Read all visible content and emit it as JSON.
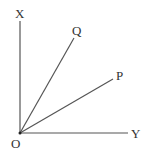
{
  "diagram": {
    "type": "angle-rays",
    "points": {
      "origin": {
        "label": "O",
        "x": 20,
        "y": 133
      },
      "X": {
        "label": "X",
        "x": 20,
        "y": 21
      },
      "Y": {
        "label": "Y",
        "x": 128,
        "y": 133
      },
      "Q": {
        "label": "Q",
        "x": 74,
        "y": 38
      },
      "P": {
        "label": "P",
        "x": 113,
        "y": 79
      }
    },
    "rays": [
      {
        "from": "O",
        "to": "X"
      },
      {
        "from": "O",
        "to": "Y"
      },
      {
        "from": "O",
        "to": "Q"
      },
      {
        "from": "O",
        "to": "P"
      }
    ],
    "line_color": "#555555",
    "label_color": "#333333"
  }
}
